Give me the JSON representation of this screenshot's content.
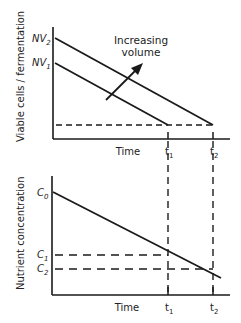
{
  "top_chart": {
    "ylabel": "Viable cells / fermentation",
    "xlabel": "Time",
    "y_ticks": {
      "nv2_base": "NV",
      "nv2_sub": "2",
      "nv1_base": "NV",
      "nv1_sub": "1"
    },
    "x_ticks": {
      "t1_base": "t",
      "t1_sub": "1",
      "t2_base": "t",
      "t2_sub": "2"
    },
    "annotation_line1": "Increasing",
    "annotation_line2": "volume"
  },
  "bottom_chart": {
    "ylabel": "Nutrient concentration",
    "xlabel": "Time",
    "y_ticks": {
      "c0_base": "C",
      "c0_sub": "0",
      "c1_base": "C",
      "c1_sub": "1",
      "c2_base": "C",
      "c2_sub": "2"
    },
    "x_ticks": {
      "t1_base": "t",
      "t1_sub": "1",
      "t2_base": "t",
      "t2_sub": "2"
    }
  },
  "colors": {
    "line": "#1a1a1a",
    "text": "#222222",
    "background": "#ffffff"
  }
}
